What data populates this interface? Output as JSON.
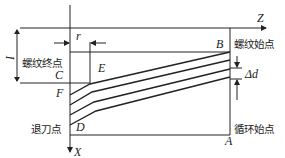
{
  "labels": {
    "Z": "Z",
    "X": "X",
    "B": "B",
    "C": "C",
    "D": "D",
    "E": "E",
    "F": "F",
    "A": "A",
    "r": "r",
    "I": "I",
    "delta_d": "Δd"
  },
  "annotations": {
    "thread_end_point": "螺纹终点",
    "thread_start_point": "螺纹始点",
    "retract_point": "退刀点",
    "cycle_start_point": "循环始点"
  }
}
